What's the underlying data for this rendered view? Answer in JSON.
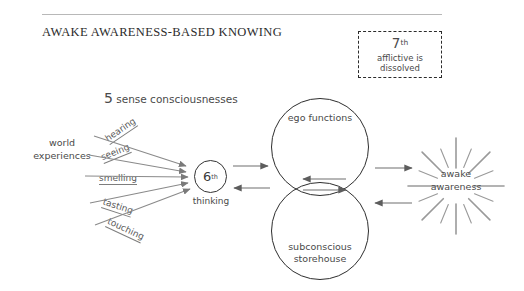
{
  "page": {
    "title": "AWAKE AWARENESS-BASED KNOWING",
    "background_color": "#ffffff",
    "ink_color": "#4a4a4a"
  },
  "afflictive_box": {
    "number": "7",
    "ordinal_suffix": "th",
    "line1": "afflictive is",
    "line2": "dissolved",
    "border_style": "dashed",
    "border_color": "#2b2b2b"
  },
  "senses": {
    "heading_number": "5",
    "heading_rest": " sense consciousnesses",
    "items": [
      {
        "label": "hearing",
        "angle_deg": -34,
        "x": 110,
        "y": 133
      },
      {
        "label": "seeing",
        "angle_deg": -22,
        "x": 104,
        "y": 152
      },
      {
        "label": "smelling",
        "angle_deg": 0,
        "x": 99,
        "y": 173
      },
      {
        "label": "tasting",
        "angle_deg": 18,
        "x": 101,
        "y": 196
      },
      {
        "label": "touching",
        "angle_deg": 25,
        "x": 105,
        "y": 215
      }
    ]
  },
  "world": {
    "line1": "world",
    "line2": "experiences"
  },
  "sixth": {
    "number": "6",
    "ordinal_suffix": "th",
    "caption": "thinking"
  },
  "circles": {
    "ego": {
      "label": "ego functions"
    },
    "subconscious": {
      "line1": "subconscious",
      "line2": "storehouse"
    }
  },
  "awake": {
    "line1": "awake",
    "line2": "awareness",
    "ray_count": 16
  },
  "arrows": {
    "sixth_to_circles_right": "arrow-right",
    "circles_to_sixth_left": "arrow-left",
    "between_circles_left": "arrow-left",
    "between_circles_right": "arrow-right",
    "circles_to_awake_right": "arrow-right",
    "awake_to_circles_left": "arrow-left"
  }
}
